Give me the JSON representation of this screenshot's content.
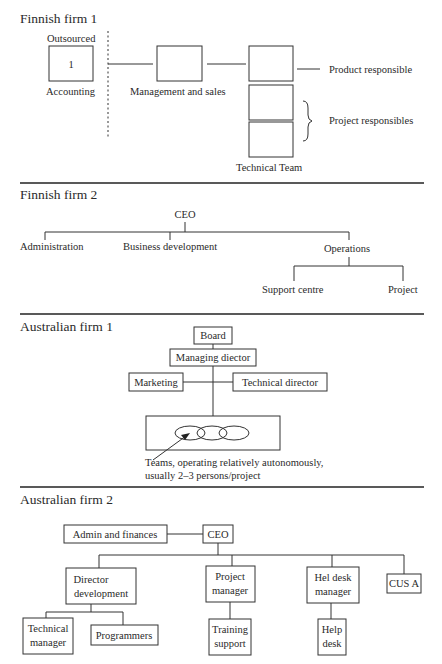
{
  "sections": [
    {
      "title": "Finnish firm 1",
      "outsourced_label": "Outsourced",
      "accounting_box_number": "1",
      "accounting_label": "Accounting",
      "management_label": "Management and sales",
      "technical_team_label": "Technical Team",
      "product_responsible_label": "Product responsible",
      "project_responsibles_label": "Project responsibles"
    },
    {
      "title": "Finnish firm 2",
      "ceo": "CEO",
      "children": [
        "Administration",
        "Business development",
        "Operations"
      ],
      "operations_children": [
        "Support centre",
        "Project"
      ]
    },
    {
      "title": "Australian firm 1",
      "board": "Board",
      "managing_director": "Managing diector",
      "marketing": "Marketing",
      "technical_director": "Technical director",
      "teams_note_line1": "Teams, operating relatively autonomously,",
      "teams_note_line2": "usually 2–3 persons/project"
    },
    {
      "title": "Australian firm 2",
      "admin": "Admin and finances",
      "ceo": "CEO",
      "director_development": [
        "Director",
        "development"
      ],
      "project_manager": [
        "Project",
        "manager"
      ],
      "help_desk_manager": [
        "Hel desk",
        "manager"
      ],
      "cus_a": "CUS A",
      "technical_manager": [
        "Technical",
        "manager"
      ],
      "programmers": "Programmers",
      "training_support": [
        "Training",
        "support"
      ],
      "help_desk": [
        "Help",
        "desk"
      ]
    }
  ]
}
